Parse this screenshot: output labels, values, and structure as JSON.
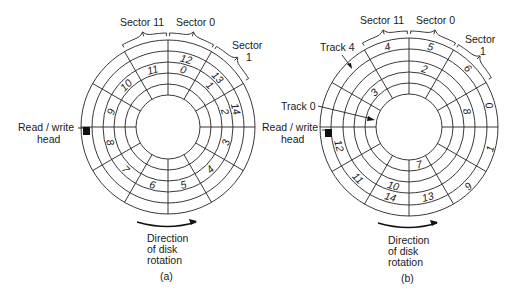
{
  "figure": {
    "panels": [
      {
        "id": "a",
        "caption": "(a)",
        "center": [
          168,
          127
        ],
        "radii": [
          32,
          43,
          54,
          65,
          76,
          87
        ],
        "sector_labels": {
          "sector_11": "Sector 11",
          "sector_0": "Sector 0",
          "sector_1_line1": "Sector",
          "sector_1_line2": "1"
        },
        "head_label": [
          "Read / write",
          "head"
        ],
        "rotation_label": [
          "Direction",
          "of disk",
          "rotation"
        ],
        "track_labels": [],
        "block_numbers": [
          {
            "n": "12",
            "sector": 0,
            "track": 3
          },
          {
            "n": "13",
            "sector": 1,
            "track": 3
          },
          {
            "n": "14",
            "sector": 2,
            "track": 3
          },
          {
            "n": "0",
            "sector": 0,
            "track": 2
          },
          {
            "n": "1",
            "sector": 1,
            "track": 2
          },
          {
            "n": "2",
            "sector": 2,
            "track": 2
          },
          {
            "n": "3",
            "sector": 3,
            "track": 2
          },
          {
            "n": "4",
            "sector": 4,
            "track": 2
          },
          {
            "n": "5",
            "sector": 5,
            "track": 2
          },
          {
            "n": "6",
            "sector": 6,
            "track": 2
          },
          {
            "n": "7",
            "sector": 7,
            "track": 2
          },
          {
            "n": "8",
            "sector": 8,
            "track": 2
          },
          {
            "n": "9",
            "sector": 9,
            "track": 2
          },
          {
            "n": "10",
            "sector": 10,
            "track": 2
          },
          {
            "n": "11",
            "sector": 11,
            "track": 2
          }
        ]
      },
      {
        "id": "b",
        "caption": "(b)",
        "center": [
          409,
          127
        ],
        "radii": [
          33,
          44,
          55,
          66,
          78,
          89
        ],
        "sector_labels": {
          "sector_11": "Sector 11",
          "sector_0": "Sector 0",
          "sector_1_line1": "Sector",
          "sector_1_line2": "1"
        },
        "head_label": [
          "Read / write",
          "head"
        ],
        "rotation_label": [
          "Direction",
          "of disk",
          "rotation"
        ],
        "track_labels": [
          {
            "text": "Track 4",
            "track": 4
          },
          {
            "text": "Track 0",
            "track": 0
          }
        ],
        "block_numbers": [
          {
            "n": "0",
            "sector": 2,
            "track": 4
          },
          {
            "n": "1",
            "sector": 3,
            "track": 4
          },
          {
            "n": "2",
            "sector": 0,
            "track": 2
          },
          {
            "n": "3",
            "sector": 10,
            "track": 1
          },
          {
            "n": "4",
            "sector": 11,
            "track": 4
          },
          {
            "n": "5",
            "sector": 0,
            "track": 4
          },
          {
            "n": "6",
            "sector": 1,
            "track": 4
          },
          {
            "n": "7",
            "sector": 5,
            "track": 0
          },
          {
            "n": "8",
            "sector": 2,
            "track": 2
          },
          {
            "n": "9",
            "sector": 4,
            "track": 4
          },
          {
            "n": "10",
            "sector": 6,
            "track": 2
          },
          {
            "n": "11",
            "sector": 7,
            "track": 3
          },
          {
            "n": "12",
            "sector": 8,
            "track": 3
          },
          {
            "n": "13",
            "sector": 5,
            "track": 3
          },
          {
            "n": "14",
            "sector": 6,
            "track": 3
          }
        ]
      }
    ],
    "sectors_per_track": 12,
    "tracks": 5
  }
}
